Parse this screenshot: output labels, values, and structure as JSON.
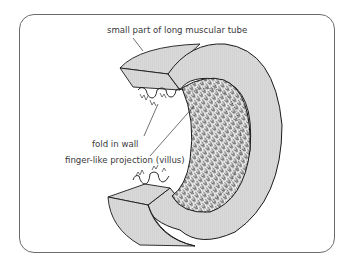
{
  "diagram": {
    "labels": {
      "tube": "small part of long muscular tube",
      "fold": "fold in wall",
      "villus": "finger-like projection (villus)"
    },
    "colors": {
      "wall_fill": "#d4d4d4",
      "outline": "#1a1a1a",
      "frame": "#6b6b6b",
      "text": "#3a3a3a"
    }
  }
}
